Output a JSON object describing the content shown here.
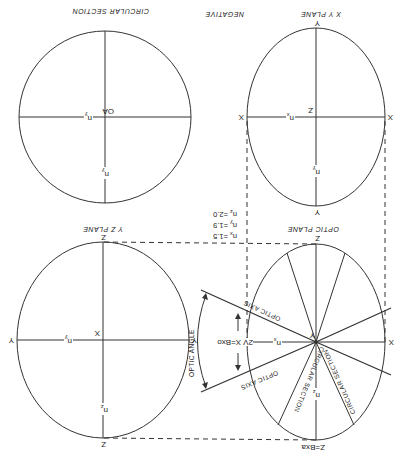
{
  "diagram": {
    "orientation": "rotated-180",
    "title": "NEGATIVE",
    "panels": {
      "circular_section": {
        "caption": "CIRCULAR SECTION",
        "center_label": "OA",
        "axis_labels": [
          "n",
          "n"
        ],
        "axis_subscripts": [
          "y",
          "y"
        ]
      },
      "xy_plane": {
        "caption": "X Y PLANE",
        "endpoints": [
          "X",
          "X",
          "Y",
          "Y"
        ],
        "center_label": "Z",
        "axis_labels": [
          "n",
          "n"
        ],
        "axis_subscripts": [
          "x",
          "y"
        ]
      },
      "yz_plane": {
        "caption": "Y Z PLANE",
        "endpoints": [
          "Y",
          "Y",
          "Z",
          "Z"
        ],
        "center_label": "X",
        "axis_labels": [
          "n",
          "n"
        ],
        "axis_subscripts": [
          "y",
          "z"
        ]
      },
      "optic_plane": {
        "caption": "OPTIC PLANE",
        "top_endpoint": "Z",
        "bottom_endpoint": "Z=Bxa",
        "left_endpoint": "X=Bxo",
        "right_endpoint": "X",
        "center_label": "Y",
        "angle_label": "2V",
        "optic_axis_label": "OPTIC AXIS",
        "optic_angle_label": "OPTIC ANGLE",
        "circular_section_label": "CIRCULAR SECTION",
        "axis_labels": [
          "n",
          "n"
        ],
        "axis_subscripts": [
          "x",
          "z"
        ]
      }
    },
    "refractive_indices": [
      {
        "symbol": "n",
        "sub": "x",
        "value": "=1.5"
      },
      {
        "symbol": "n",
        "sub": "y",
        "value": "=1.9"
      },
      {
        "symbol": "n",
        "sub": "z",
        "value": "=2.0"
      }
    ]
  }
}
